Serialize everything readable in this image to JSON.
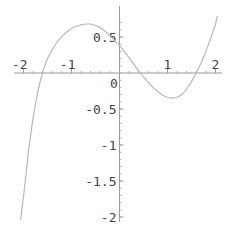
{
  "chart_data": {
    "type": "line",
    "title": "",
    "xlabel": "",
    "ylabel": "",
    "xlim": [
      -2.06,
      2.04
    ],
    "ylim": [
      -2.05,
      0.8
    ],
    "grid": false,
    "legend": null,
    "x_ticks": [
      {
        "value": -2,
        "label": "-2"
      },
      {
        "value": -1,
        "label": "-1"
      },
      {
        "value": 1,
        "label": "1"
      },
      {
        "value": 2,
        "label": "2"
      }
    ],
    "y_ticks": [
      {
        "value": 0.5,
        "label": "0.5"
      },
      {
        "value": 0,
        "label": "0"
      },
      {
        "value": -0.5,
        "label": "-0.5"
      },
      {
        "value": -1,
        "label": "-1"
      },
      {
        "value": -1.5,
        "label": "-1.5"
      },
      {
        "value": -2,
        "label": "-2"
      }
    ],
    "series": [
      {
        "name": "f(x)",
        "color": "#b8b8b8",
        "x": [
          -2.06,
          -1.98,
          -1.9,
          -1.8,
          -1.7,
          -1.6,
          -1.5,
          -1.4,
          -1.3,
          -1.2,
          -1.1,
          -1.0,
          -0.9,
          -0.8,
          -0.7,
          -0.6,
          -0.5,
          -0.4,
          -0.3,
          -0.2,
          -0.1,
          0.0,
          0.1,
          0.2,
          0.3,
          0.4,
          0.5,
          0.6,
          0.7,
          0.8,
          0.9,
          1.0,
          1.1,
          1.2,
          1.3,
          1.4,
          1.5,
          1.6,
          1.7,
          1.8,
          1.9,
          2.0,
          2.04
        ],
        "y": [
          -2.04,
          -1.6,
          -1.1,
          -0.62,
          -0.25,
          0.02,
          0.2,
          0.33,
          0.43,
          0.51,
          0.57,
          0.62,
          0.65,
          0.67,
          0.68,
          0.68,
          0.66,
          0.63,
          0.58,
          0.52,
          0.45,
          0.38,
          0.3,
          0.21,
          0.12,
          0.03,
          -0.05,
          -0.13,
          -0.2,
          -0.26,
          -0.31,
          -0.34,
          -0.35,
          -0.34,
          -0.3,
          -0.22,
          -0.12,
          0.0,
          0.14,
          0.3,
          0.48,
          0.68,
          0.79
        ]
      }
    ]
  },
  "axes": {
    "axis_color": "#999999",
    "origin_label": "0"
  }
}
